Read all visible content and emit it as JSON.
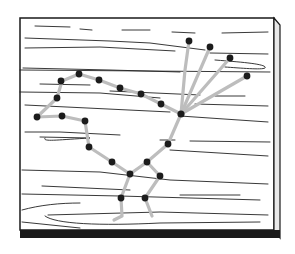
{
  "illustration": {
    "subject": "String art roadrunner on wood board",
    "colors": {
      "background": "#ffffff",
      "outline": "#1a1a1a",
      "grain": "#222222",
      "string": "#bdbdbd",
      "nail": "#1c1c1c",
      "bottom_edge": "#1a1a1a"
    },
    "board": {
      "x": 20,
      "y": 18,
      "w": 254,
      "h": 212,
      "side_w": 7,
      "bottom_h": 8
    },
    "nails": [
      [
        37,
        117
      ],
      [
        57,
        98
      ],
      [
        62,
        116
      ],
      [
        85,
        121
      ],
      [
        89,
        147
      ],
      [
        112,
        162
      ],
      [
        130,
        174
      ],
      [
        147,
        162
      ],
      [
        168,
        144
      ],
      [
        181,
        114
      ],
      [
        161,
        104
      ],
      [
        141,
        94
      ],
      [
        120,
        88
      ],
      [
        99,
        80
      ],
      [
        79,
        74
      ],
      [
        61,
        81
      ],
      [
        56,
        98
      ],
      [
        189,
        41
      ],
      [
        210,
        47
      ],
      [
        230,
        58
      ],
      [
        247,
        76
      ],
      [
        160,
        176
      ],
      [
        121,
        198
      ],
      [
        145,
        198
      ]
    ],
    "strings": [
      "M37,117 L57,98 L62,81 L79,74 L99,80 L120,88 L141,94 L161,104 L181,114",
      "M37,117 L62,116 L85,121 L89,147 L112,162 L130,174",
      "M181,114 L168,144 L147,162 L130,174",
      "M181,114 L189,41",
      "M181,114 L210,47",
      "M181,114 L230,58",
      "M181,114 L247,76",
      "M147,162 L160,176 L145,198 L152,216",
      "M130,174 L121,198 L122,216 L114,220"
    ]
  }
}
